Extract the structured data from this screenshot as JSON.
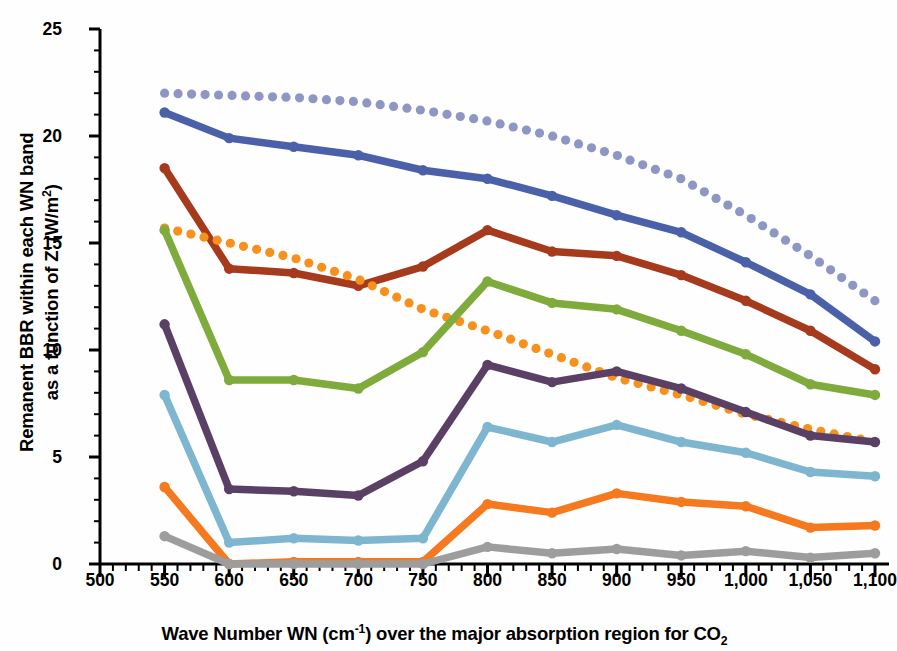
{
  "titles": {
    "top_partial": "",
    "y_axis_main": "Remanent BBR within each WN band",
    "y_axis_second": "as a function of Z′ (W/m",
    "y_axis_sup": "2",
    "y_axis_tail": ")",
    "x_axis_a": "Wave Number WN (cm",
    "x_axis_sup": "-1",
    "x_axis_b": ") over the major absorption region for CO",
    "x_axis_sub": "2"
  },
  "axes": {
    "x_ticks": [
      "500",
      "550",
      "600",
      "650",
      "700",
      "750",
      "800",
      "850",
      "900",
      "950",
      "1,000",
      "1,050",
      "1,100"
    ],
    "y_ticks": [
      "0",
      "5",
      "10",
      "15",
      "20",
      "25"
    ],
    "xlim": [
      500,
      1100
    ],
    "ylim": [
      0,
      25
    ],
    "x_minor_step": 10,
    "y_minor_step": 1,
    "grid": false
  },
  "chart_data": {
    "type": "line",
    "title": "",
    "xlabel": "Wave Number WN (cm-1) over the major absorption region for CO2",
    "ylabel": "Remanent BBR within each WN band as a function of Z′ (W/m2)",
    "xlim": [
      500,
      1100
    ],
    "ylim": [
      0,
      25
    ],
    "x": [
      550,
      600,
      650,
      700,
      750,
      800,
      850,
      900,
      950,
      1000,
      1050,
      1100
    ],
    "legend": "none",
    "series": [
      {
        "name": "periwinkle-dotted",
        "color": "#8e97c4",
        "style": "dotted",
        "values": [
          22.0,
          21.9,
          21.8,
          21.6,
          21.2,
          20.7,
          20.0,
          19.1,
          18.0,
          16.3,
          14.4,
          12.3
        ]
      },
      {
        "name": "blue-solid",
        "color": "#4a60a8",
        "style": "solid",
        "values": [
          21.1,
          19.9,
          19.5,
          19.1,
          18.4,
          18.0,
          17.2,
          16.3,
          15.5,
          14.1,
          12.6,
          10.4
        ]
      },
      {
        "name": "darkred-solid",
        "color": "#a63a1c",
        "style": "solid",
        "values": [
          18.5,
          13.8,
          13.6,
          13.0,
          13.9,
          15.6,
          14.6,
          14.4,
          13.5,
          12.3,
          10.9,
          9.1
        ]
      },
      {
        "name": "orange-dotted",
        "color": "#f6911e",
        "style": "dotted",
        "values": [
          15.7,
          15.0,
          14.3,
          13.3,
          11.9,
          10.9,
          9.8,
          8.7,
          7.9,
          7.0,
          6.3,
          5.7
        ]
      },
      {
        "name": "green-solid",
        "color": "#7fab3c",
        "style": "solid",
        "values": [
          15.6,
          8.6,
          8.6,
          8.2,
          9.9,
          13.2,
          12.2,
          11.9,
          10.9,
          9.8,
          8.4,
          7.9
        ]
      },
      {
        "name": "purple-solid",
        "color": "#5b4066",
        "style": "solid",
        "values": [
          11.2,
          3.5,
          3.4,
          3.2,
          4.8,
          9.3,
          8.5,
          9.0,
          8.2,
          7.1,
          6.0,
          5.7
        ]
      },
      {
        "name": "lightblue-solid",
        "color": "#7eb6cf",
        "style": "solid",
        "values": [
          7.9,
          1.0,
          1.2,
          1.1,
          1.2,
          6.4,
          5.7,
          6.5,
          5.7,
          5.2,
          4.3,
          4.1
        ]
      },
      {
        "name": "orange-solid",
        "color": "#f4791f",
        "style": "solid",
        "values": [
          3.6,
          0.0,
          0.1,
          0.1,
          0.1,
          2.8,
          2.4,
          3.3,
          2.9,
          2.7,
          1.7,
          1.8
        ]
      },
      {
        "name": "gray-solid",
        "color": "#9d9d9d",
        "style": "solid",
        "values": [
          1.3,
          0.0,
          0.0,
          0.0,
          0.0,
          0.8,
          0.5,
          0.7,
          0.4,
          0.6,
          0.3,
          0.5
        ]
      }
    ]
  }
}
